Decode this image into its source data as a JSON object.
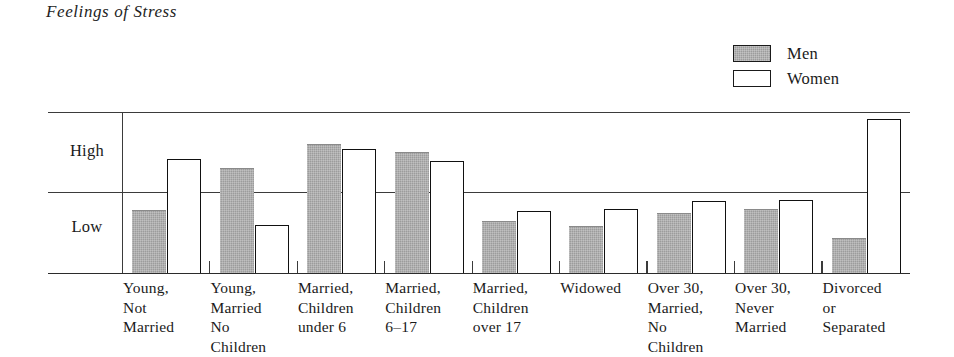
{
  "chart_data": {
    "type": "bar",
    "title": "Feelings of Stress",
    "xlabel": "",
    "ylabel": "",
    "ytick_labels": [
      "High",
      "Low"
    ],
    "ylim": [
      0,
      2
    ],
    "grid": true,
    "legend_position": "top-right",
    "categories": [
      "Young, Not Married",
      "Young, Married No Children",
      "Married, Children under 6",
      "Married, Children 6–17",
      "Married, Children over 17",
      "Widowed",
      "Over 30, Married, No Children",
      "Over 30, Never Married",
      "Divorced or Separated"
    ],
    "category_lines": [
      [
        "Young,",
        "Not",
        "Married"
      ],
      [
        "Young,",
        "Married",
        "No",
        "Children"
      ],
      [
        "Married,",
        "Children",
        "under 6"
      ],
      [
        "Married,",
        "Children",
        "6–17"
      ],
      [
        "Married,",
        "Children",
        "over 17"
      ],
      [
        "Widowed"
      ],
      [
        "Over 30,",
        "Married,",
        "No",
        "Children"
      ],
      [
        "Over 30,",
        "Never",
        "Married"
      ],
      [
        "Divorced",
        "or",
        "Separated"
      ]
    ],
    "series": [
      {
        "name": "Men",
        "color": "#9c9c9c",
        "values": [
          0.78,
          1.3,
          1.6,
          1.5,
          0.64,
          0.58,
          0.75,
          0.8,
          0.44
        ]
      },
      {
        "name": "Women",
        "color": "#ffffff",
        "values": [
          1.42,
          0.6,
          1.54,
          1.39,
          0.77,
          0.8,
          0.89,
          0.91,
          1.91
        ]
      }
    ]
  },
  "title": {
    "text": "Feelings of Stress"
  },
  "legend": {
    "items": [
      {
        "label": "Men",
        "swatch": "men-swatch"
      },
      {
        "label": "Women",
        "swatch": "women-swatch"
      }
    ]
  },
  "axis": {
    "high_label": "High",
    "low_label": "Low"
  }
}
